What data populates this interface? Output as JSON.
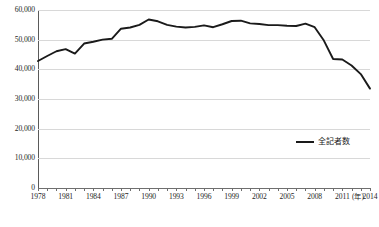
{
  "chart_data": {
    "type": "line",
    "title": "",
    "xlabel": "年",
    "ylabel": "",
    "ylim": [
      0,
      60000
    ],
    "xlim": [
      1978,
      2014
    ],
    "grid": true,
    "legend_position": "bottom-right",
    "y_ticks": [
      "0",
      "10,000",
      "20,000",
      "30,000",
      "40,000",
      "50,000",
      "60,000"
    ],
    "y_tick_values": [
      0,
      10000,
      20000,
      30000,
      40000,
      50000,
      60000
    ],
    "x_tick_labels": [
      "1978",
      "1981",
      "1984",
      "1987",
      "1990",
      "1993",
      "1996",
      "1999",
      "2002",
      "2005",
      "2008",
      "2011",
      "2014"
    ],
    "x_tick_values": [
      1978,
      1981,
      1984,
      1987,
      1990,
      1993,
      1996,
      1999,
      2002,
      2005,
      2008,
      2011,
      2014
    ],
    "x_axis_unit": "(年)",
    "series": [
      {
        "name": "全記者数",
        "color": "#1a1a1a",
        "x": [
          1978,
          1979,
          1980,
          1981,
          1982,
          1983,
          1984,
          1985,
          1986,
          1987,
          1988,
          1989,
          1990,
          1991,
          1992,
          1993,
          1994,
          1995,
          1996,
          1997,
          1998,
          1999,
          2000,
          2001,
          2002,
          2003,
          2004,
          2005,
          2006,
          2007,
          2008,
          2009,
          2010,
          2011,
          2012,
          2013,
          2014
        ],
        "values": [
          42800,
          44500,
          46100,
          46800,
          45300,
          48700,
          49300,
          50000,
          50300,
          53700,
          54100,
          55000,
          56800,
          56200,
          55000,
          54400,
          54100,
          54300,
          54800,
          54200,
          55200,
          56300,
          56400,
          55500,
          55300,
          54900,
          54900,
          54700,
          54600,
          55400,
          54200,
          49700,
          43500,
          43300,
          41300,
          38400,
          33500
        ]
      }
    ]
  },
  "legend": {
    "entries": [
      {
        "label": "全記者数",
        "color": "#1a1a1a"
      }
    ]
  },
  "source_caption": ""
}
